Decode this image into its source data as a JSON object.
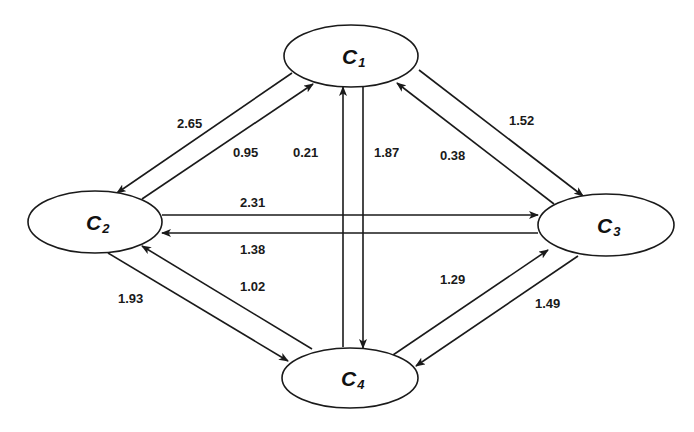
{
  "diagram": {
    "type": "directed-weighted-graph",
    "nodes": [
      {
        "id": "C1",
        "letter": "C",
        "sub": "1",
        "cx": 351,
        "cy": 56,
        "rx": 67,
        "ry": 31
      },
      {
        "id": "C2",
        "letter": "C",
        "sub": "2",
        "cx": 95,
        "cy": 222,
        "rx": 67,
        "ry": 31
      },
      {
        "id": "C3",
        "letter": "C",
        "sub": "3",
        "cx": 606,
        "cy": 225,
        "rx": 68,
        "ry": 31
      },
      {
        "id": "C4",
        "letter": "C",
        "sub": "4",
        "cx": 350,
        "cy": 378,
        "rx": 68,
        "ry": 30
      }
    ],
    "edges": [
      {
        "from": "C1",
        "to": "C2",
        "weight": "2.65",
        "x1": 292,
        "y1": 73,
        "x2": 117,
        "y2": 193,
        "lx": 177,
        "ly": 128
      },
      {
        "from": "C2",
        "to": "C1",
        "weight": "0.95",
        "x1": 142,
        "y1": 199,
        "x2": 313,
        "y2": 84,
        "lx": 233,
        "ly": 157
      },
      {
        "from": "C4",
        "to": "C1",
        "weight": "0.21",
        "x1": 343,
        "y1": 347,
        "x2": 343,
        "y2": 87,
        "lx": 293,
        "ly": 157
      },
      {
        "from": "C1",
        "to": "C4",
        "weight": "1.87",
        "x1": 363,
        "y1": 87,
        "x2": 363,
        "y2": 348,
        "lx": 374,
        "ly": 157
      },
      {
        "from": "C1",
        "to": "C3",
        "weight": "1.52",
        "x1": 419,
        "y1": 70,
        "x2": 583,
        "y2": 196,
        "lx": 509,
        "ly": 125
      },
      {
        "from": "C3",
        "to": "C1",
        "weight": "0.38",
        "x1": 554,
        "y1": 204,
        "x2": 397,
        "y2": 83,
        "lx": 440,
        "ly": 160
      },
      {
        "from": "C2",
        "to": "C3",
        "weight": "2.31",
        "x1": 162,
        "y1": 215,
        "x2": 538,
        "y2": 215,
        "lx": 240,
        "ly": 207
      },
      {
        "from": "C3",
        "to": "C2",
        "weight": "1.38",
        "x1": 538,
        "y1": 233,
        "x2": 162,
        "y2": 233,
        "lx": 240,
        "ly": 254
      },
      {
        "from": "C2",
        "to": "C4",
        "weight": "1.93",
        "x1": 108,
        "y1": 253,
        "x2": 288,
        "y2": 361,
        "lx": 118,
        "ly": 303
      },
      {
        "from": "C4",
        "to": "C2",
        "weight": "1.02",
        "x1": 312,
        "y1": 349,
        "x2": 142,
        "y2": 246,
        "lx": 240,
        "ly": 291
      },
      {
        "from": "C4",
        "to": "C3",
        "weight": "1.29",
        "x1": 393,
        "y1": 355,
        "x2": 548,
        "y2": 250,
        "lx": 440,
        "ly": 284
      },
      {
        "from": "C3",
        "to": "C4",
        "weight": "1.49",
        "x1": 578,
        "y1": 256,
        "x2": 416,
        "y2": 366,
        "lx": 535,
        "ly": 308
      }
    ]
  },
  "colors": {
    "stroke": "#1a1a1a",
    "background": "#ffffff",
    "text": "#111111"
  }
}
